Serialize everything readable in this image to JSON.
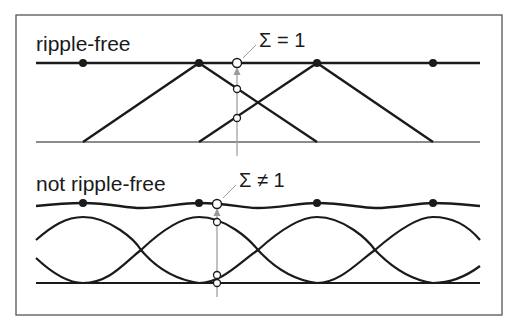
{
  "figure": {
    "frame_color": "#555555",
    "line_color": "#1a1a1a",
    "arrow_color": "#9a9a9a"
  },
  "panels": [
    {
      "id": "ripple-free",
      "title": "ripple-free",
      "sum_label": "Σ = 1",
      "kernel_shape": "triangle",
      "sample_points_x": [
        83,
        199,
        317,
        433
      ],
      "probe_x": 237
    },
    {
      "id": "not-ripple-free",
      "title": "not ripple-free",
      "sum_label": "Σ ≠ 1",
      "kernel_shape": "gaussian",
      "sample_points_x": [
        83,
        199,
        317,
        433
      ],
      "probe_x": 217
    }
  ]
}
